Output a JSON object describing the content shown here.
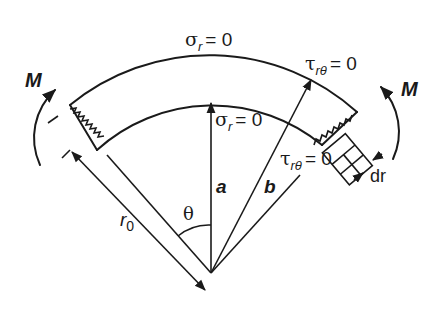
{
  "diagram": {
    "labels": {
      "outer_boundary": "σr = 0",
      "outer_sigma_sym": "σ",
      "outer_sigma_sub": "r",
      "outer_sigma_eq": "= 0",
      "inner_sigma_sym": "σ",
      "inner_sigma_sub": "r",
      "inner_sigma_eq": "= 0",
      "outer_tau_sym": "τ",
      "outer_tau_sub": "rθ",
      "outer_tau_eq": "= 0",
      "inner_tau_sym": "τ",
      "inner_tau_sub": "rθ",
      "inner_tau_eq": "= 0",
      "moment_left": "M",
      "moment_right": "M",
      "inner_radius": "a",
      "outer_radius": "b",
      "neutral_radius_sym": "r",
      "neutral_radius_sub": "0",
      "angle": "θ",
      "element_thickness": "dr"
    },
    "colors": {
      "ink": "#1a1a1a",
      "background": "#ffffff"
    }
  }
}
